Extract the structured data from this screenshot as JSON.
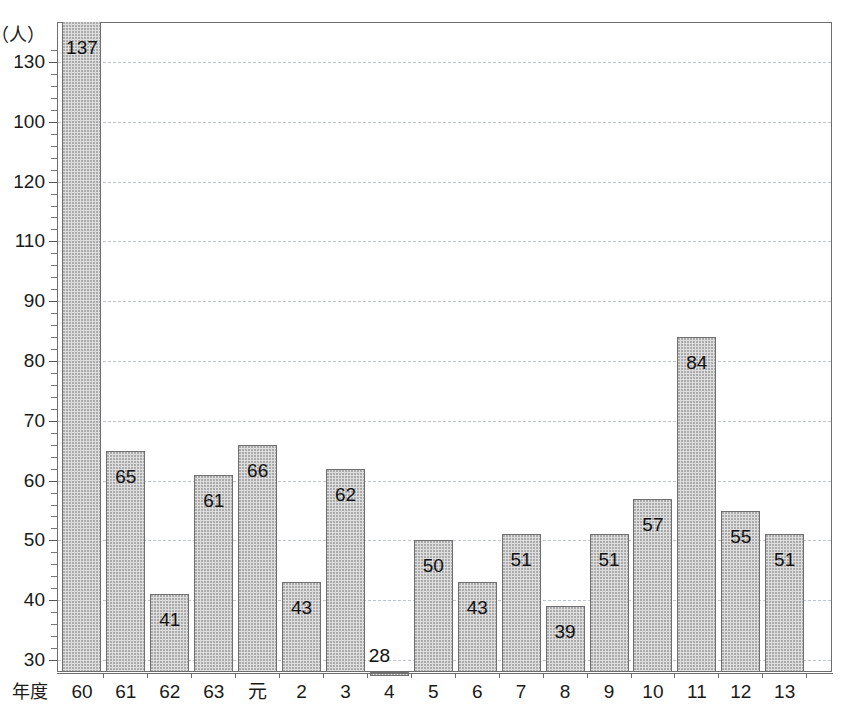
{
  "title_strip": {
    "ghost_text": "─ ── ──── ──  ────"
  },
  "chart_data": {
    "type": "bar",
    "title": "",
    "subtitle": "",
    "xlabel": "年度",
    "ylabel": "",
    "y_unit": "（人）",
    "categories": [
      "60",
      "61",
      "62",
      "63",
      "元",
      "2",
      "3",
      "4",
      "5",
      "6",
      "7",
      "8",
      "9",
      "10",
      "11",
      "12",
      "13"
    ],
    "values": [
      137,
      65,
      41,
      61,
      66,
      43,
      62,
      28,
      50,
      43,
      51,
      39,
      51,
      57,
      84,
      55,
      51
    ],
    "data_labels": [
      "137",
      "65",
      "41",
      "61",
      "66",
      "43",
      "62",
      "28",
      "50",
      "43",
      "51",
      "39",
      "51",
      "57",
      "84",
      "55",
      "51"
    ],
    "ylim": [
      30,
      130
    ],
    "ytick_labels": [
      "130",
      "100",
      "120",
      "110",
      "90",
      "80",
      "70",
      "60",
      "50",
      "40",
      "30"
    ],
    "ytick_positions": [
      130,
      120,
      110,
      100,
      90,
      80,
      70,
      60,
      50,
      40,
      30
    ],
    "minor_tick_step": 2,
    "grid": true,
    "grid_style": "dashed",
    "legend": "none",
    "bar_fill_color": "#dedede",
    "bar_border_color": "#707070",
    "grid_color": "#bfc6cf",
    "axis_color": "#6e6e6e",
    "note": "y-axis printed labels appear out of order in the source scan (100 above 120)"
  }
}
